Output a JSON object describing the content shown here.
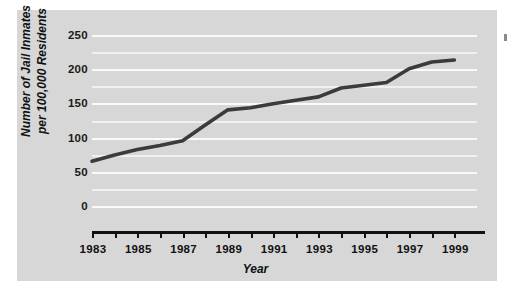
{
  "chart_data": {
    "type": "line",
    "title": "",
    "xlabel": "Year",
    "ylabel_line1": "Number of Jail Inmates",
    "ylabel_line2": "per 100,000 Residents",
    "ylabel": "Number of Jail Inmates per 100,000 Residents",
    "xlim": [
      1983,
      2000
    ],
    "ylim": [
      0,
      250
    ],
    "grid": true,
    "legend": null,
    "yticks": [
      250,
      200,
      150,
      100,
      50,
      0
    ],
    "xticks_all": [
      1983,
      1984,
      1985,
      1986,
      1987,
      1988,
      1989,
      1990,
      1991,
      1992,
      1993,
      1994,
      1995,
      1996,
      1997,
      1998,
      1999
    ],
    "xtick_labels": [
      "1983",
      "1985",
      "1987",
      "1989",
      "1991",
      "1993",
      "1995",
      "1997",
      "1999"
    ],
    "xtick_labeled_years": [
      1983,
      1985,
      1987,
      1989,
      1991,
      1993,
      1995,
      1997,
      1999
    ],
    "x": [
      1983,
      1984,
      1985,
      1986,
      1987,
      1988,
      1989,
      1990,
      1991,
      1992,
      1993,
      1994,
      1995,
      1996,
      1997,
      1998,
      1999
    ],
    "values": [
      67,
      76,
      84,
      90,
      97,
      120,
      142,
      145,
      151,
      156,
      161,
      174,
      178,
      182,
      202,
      212,
      215
    ],
    "series": [
      {
        "name": "Jail inmates per 100,000 residents",
        "color": "#3b3b3b",
        "values": [
          67,
          76,
          84,
          90,
          97,
          120,
          142,
          145,
          151,
          156,
          161,
          174,
          178,
          182,
          202,
          212,
          215
        ]
      }
    ],
    "colors": {
      "panel_background": "#d7d7d7",
      "gridline": "#fafafa",
      "line": "#3b3b3b",
      "axis": "#111111",
      "text": "#111111",
      "page_background": "#ffffff"
    }
  }
}
